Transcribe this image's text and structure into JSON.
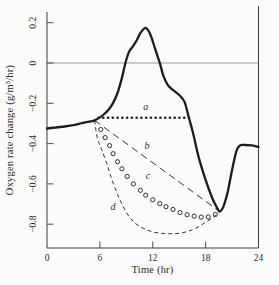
{
  "figure": {
    "background": "#fcfcfa",
    "ink": "#1c1c1c",
    "axis_color": "#3c3c3c",
    "zero_line_color": "#6e6e6e"
  },
  "chart_data": {
    "type": "line",
    "title": "",
    "xlabel": "Time (hr)",
    "ylabel": "Oxygen rate change (g/m³/hr)",
    "xlim": [
      0,
      24
    ],
    "ylim": [
      -0.92,
      0.25
    ],
    "grid": false,
    "zero_line": true,
    "x_ticks": [
      0,
      6,
      12,
      18,
      24
    ],
    "x_tick_labels": [
      "0",
      "6",
      "12",
      "18",
      "24"
    ],
    "y_ticks": [
      0.2,
      0,
      -0.2,
      -0.4,
      -0.6,
      -0.8
    ],
    "y_tick_labels": [
      "0.2",
      "0",
      "−0.2",
      "−0.4",
      "−0.6",
      "−0.8"
    ],
    "series": [
      {
        "name": "measured-oxygen-rate",
        "label": "",
        "style": "solid-bold",
        "x": [
          0,
          1,
          2,
          3,
          4,
          5,
          5.4,
          6,
          6.5,
          7,
          7.5,
          8,
          8.5,
          8.9,
          9.3,
          9.7,
          10.2,
          10.6,
          11.2,
          11.7,
          12.2,
          12.8,
          13.2,
          13.7,
          14.3,
          15,
          15.6,
          16.1,
          16.6,
          17.2,
          18,
          18.7,
          19.3,
          19.6,
          20,
          20.5,
          21,
          21.5,
          21.9,
          22.5,
          23.2,
          24
        ],
        "y": [
          -0.325,
          -0.32,
          -0.315,
          -0.308,
          -0.298,
          -0.29,
          -0.285,
          -0.27,
          -0.253,
          -0.231,
          -0.198,
          -0.149,
          -0.074,
          0,
          0.055,
          0.08,
          0.114,
          0.149,
          0.174,
          0.144,
          0.08,
          0,
          -0.063,
          -0.108,
          -0.134,
          -0.159,
          -0.193,
          -0.272,
          -0.352,
          -0.466,
          -0.58,
          -0.665,
          -0.719,
          -0.737,
          -0.714,
          -0.64,
          -0.531,
          -0.436,
          -0.409,
          -0.407,
          -0.409,
          -0.417
        ]
      },
      {
        "name": "curve-a",
        "label": "a",
        "style": "dotted-horizontal",
        "y_value": -0.272,
        "x_start": 5.85,
        "x_end": 16.11,
        "dot_step": 0.54,
        "label_pos": [
          11.2,
          -0.235
        ]
      },
      {
        "name": "curve-b",
        "label": "b",
        "style": "dashed-straight",
        "x": [
          5.4,
          19.6
        ],
        "y": [
          -0.285,
          -0.737
        ],
        "label_pos": [
          11.35,
          -0.425
        ]
      },
      {
        "name": "curve-c",
        "label": "c",
        "style": "open-circles",
        "x": [
          6.1,
          6.6,
          7.1,
          7.5,
          8.0,
          8.5,
          9.1,
          9.8,
          10.6,
          11.2,
          12.0,
          12.8,
          13.5,
          14.3,
          15.1,
          15.9,
          16.7,
          17.5,
          18.3,
          19.1
        ],
        "y": [
          -0.33,
          -0.37,
          -0.41,
          -0.45,
          -0.49,
          -0.525,
          -0.563,
          -0.6,
          -0.632,
          -0.656,
          -0.679,
          -0.698,
          -0.713,
          -0.727,
          -0.742,
          -0.753,
          -0.76,
          -0.765,
          -0.764,
          -0.752
        ],
        "label_pos": [
          11.45,
          -0.578
        ]
      },
      {
        "name": "curve-d",
        "label": "d",
        "style": "fine-dashed",
        "x": [
          5.4,
          5.7,
          6.2,
          6.8,
          7.3,
          7.9,
          8.5,
          9.2,
          10,
          11,
          12,
          13,
          14,
          15,
          16,
          17,
          18,
          18.8,
          19.6
        ],
        "y": [
          -0.285,
          -0.37,
          -0.43,
          -0.5,
          -0.57,
          -0.64,
          -0.7,
          -0.755,
          -0.795,
          -0.822,
          -0.838,
          -0.845,
          -0.847,
          -0.845,
          -0.835,
          -0.818,
          -0.79,
          -0.768,
          -0.737
        ],
        "label_pos": [
          7.5,
          -0.73
        ]
      }
    ]
  }
}
